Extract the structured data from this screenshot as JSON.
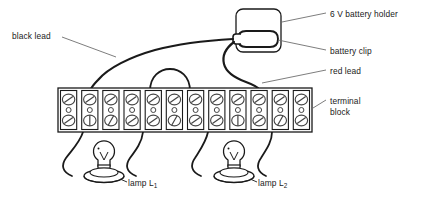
{
  "diagram": {
    "stroke_color": "#1a1a1a",
    "leader_color": "#6e6e6e",
    "background_color": "#ffffff",
    "fill_color": "#ffffff"
  },
  "labels": {
    "battery_holder": "6 V battery holder",
    "battery_clip": "battery clip",
    "red_lead": "red lead",
    "terminal_block_line1": "terminal",
    "terminal_block_line2": "block",
    "black_lead": "black lead",
    "lamp1_prefix": "lamp L",
    "lamp1_subscript": "1",
    "lamp2_prefix": "lamp L",
    "lamp2_subscript": "2"
  },
  "components": {
    "battery_holder": {
      "name": "6 V battery holder",
      "shape": "rounded-rectangle",
      "x": 236,
      "y": 9,
      "width": 45,
      "height": 43,
      "corner_radius": 7
    },
    "battery_clip": {
      "name": "battery clip",
      "shape": "rounded-oval",
      "x": 238,
      "y": 31,
      "width": 40,
      "height": 16
    },
    "terminal_block": {
      "name": "terminal block",
      "x": 58,
      "y": 88,
      "width": 254,
      "height": 44,
      "cell_count": 12,
      "screw_rows": 2
    },
    "lamp1": {
      "name": "lamp L1",
      "center_x": 104,
      "bulb_center_y": 157,
      "bulb_radius": 10.5,
      "holder_y": 176
    },
    "lamp2": {
      "name": "lamp L2",
      "center_x": 234,
      "bulb_center_y": 157,
      "bulb_radius": 10.5,
      "holder_y": 176
    }
  },
  "wires": [
    {
      "name": "black-lead",
      "from": "battery clip left",
      "to": "terminal block top left",
      "stroke_width": 2.1
    },
    {
      "name": "red-lead",
      "from": "battery clip left",
      "to": "terminal block top right",
      "stroke_width": 2.1
    },
    {
      "name": "jumper-link",
      "from": "terminal block top",
      "to": "terminal block top",
      "stroke_width": 1.7
    },
    {
      "name": "lamp1-left-wire",
      "from": "terminal block bottom",
      "to": "lamp L1 holder left",
      "stroke_width": 1.7
    },
    {
      "name": "lamp1-right-wire",
      "from": "terminal block bottom",
      "to": "lamp L1 holder right",
      "stroke_width": 1.7
    },
    {
      "name": "lamp2-left-wire",
      "from": "terminal block bottom",
      "to": "lamp L2 holder left",
      "stroke_width": 1.7
    },
    {
      "name": "lamp2-right-wire",
      "from": "terminal block bottom",
      "to": "lamp L2 holder right",
      "stroke_width": 1.7
    }
  ],
  "leader_lines": [
    {
      "name": "leader-battery-holder",
      "x1": 282,
      "y1": 22,
      "x2": 326,
      "y2": 13
    },
    {
      "name": "leader-battery-clip",
      "x1": 278,
      "y1": 40,
      "x2": 326,
      "y2": 50
    },
    {
      "name": "leader-red-lead",
      "x1": 262,
      "y1": 83,
      "x2": 326,
      "y2": 70
    },
    {
      "name": "leader-terminal-block",
      "x1": 313,
      "y1": 108,
      "x2": 326,
      "y2": 100
    },
    {
      "name": "leader-black-lead",
      "x1": 62,
      "y1": 37,
      "x2": 116,
      "y2": 57
    }
  ]
}
